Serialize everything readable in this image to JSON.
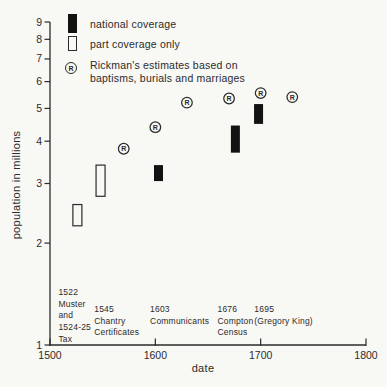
{
  "figure": {
    "background": "#f8f8f5",
    "ink": "#2b2b2b",
    "bar_fill": "#121212",
    "r_letter": "R"
  },
  "legend": {
    "items": [
      {
        "marker": "filled-bar",
        "lines": [
          "national coverage"
        ]
      },
      {
        "marker": "open-bar",
        "lines": [
          "part coverage only"
        ]
      },
      {
        "marker": "circled-R",
        "lines": [
          "Rickman's estimates based on",
          "baptisms, burials and marriages"
        ]
      }
    ]
  },
  "chart_data": {
    "type": "scatter",
    "xlabel": "date",
    "ylabel": "population in millions",
    "x_axis": {
      "scale": "linear",
      "min": 1500,
      "max": 1800,
      "ticks": [
        1500,
        1600,
        1700,
        1800
      ]
    },
    "y_axis": {
      "scale": "log",
      "min": 1,
      "max": 9,
      "ticks": [
        1,
        2,
        3,
        4,
        5,
        6,
        7,
        8,
        9
      ]
    },
    "series": [
      {
        "name": "national coverage",
        "marker": "filled-bar",
        "points": [
          {
            "date": 1603,
            "low": 3.05,
            "high": 3.4
          },
          {
            "date": 1676,
            "low": 3.7,
            "high": 4.45
          },
          {
            "date": 1698,
            "low": 4.5,
            "high": 5.15
          }
        ]
      },
      {
        "name": "part coverage only",
        "marker": "open-bar",
        "points": [
          {
            "date": 1526,
            "low": 2.25,
            "high": 2.6
          },
          {
            "date": 1548,
            "low": 2.75,
            "high": 3.4
          }
        ]
      },
      {
        "name": "Rickman's estimates based on baptisms, burials and marriages",
        "marker": "circled-R",
        "points": [
          {
            "date": 1570,
            "value": 3.8
          },
          {
            "date": 1600,
            "value": 4.4
          },
          {
            "date": 1630,
            "value": 5.2
          },
          {
            "date": 1670,
            "value": 5.35
          },
          {
            "date": 1700,
            "value": 5.55
          },
          {
            "date": 1730,
            "value": 5.4
          }
        ]
      }
    ],
    "annotations": [
      {
        "anchor_date": 1508,
        "lines": [
          "1522",
          "Muster",
          "and",
          "1524-25",
          "Tax"
        ]
      },
      {
        "anchor_date": 1542,
        "lines": [
          "1545",
          "Chantry",
          "Certificates"
        ]
      },
      {
        "anchor_date": 1595,
        "lines": [
          "1603",
          "Communicants"
        ]
      },
      {
        "anchor_date": 1659,
        "lines": [
          "1676",
          "Compton",
          "Census"
        ]
      },
      {
        "anchor_date": 1694,
        "lines": [
          "1695",
          "(Gregory King)"
        ]
      }
    ]
  }
}
